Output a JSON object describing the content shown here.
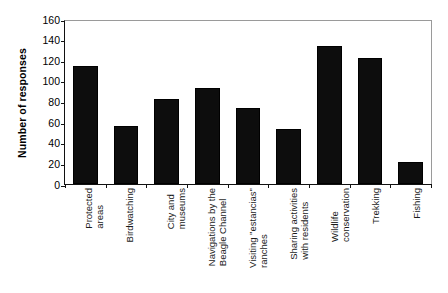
{
  "chart_data": {
    "type": "bar",
    "title": "",
    "xlabel": "",
    "ylabel": "Number of responses",
    "ylim": [
      0,
      160
    ],
    "ytick_step": 20,
    "yticks": [
      160,
      140,
      120,
      100,
      80,
      60,
      40,
      20,
      0
    ],
    "grid": false,
    "legend": null,
    "bar_color": "#0d0d0d",
    "categories": [
      "Protected areas",
      "Birdwatching",
      "City and museums",
      "Navigations by the Beagle Channel",
      "Visiting \"estancias\" ranches",
      "Sharing activities with residents",
      "Wildlife conservation",
      "Trekking",
      "Fishing"
    ],
    "category_lines": [
      [
        "Protected",
        "areas"
      ],
      [
        "Birdwatching",
        ""
      ],
      [
        "City and",
        "museums"
      ],
      [
        "Navigations by the",
        "Beagle Channel"
      ],
      [
        "Visiting \"estancias\"",
        "ranches"
      ],
      [
        "Sharing activities",
        "with residents"
      ],
      [
        "Wildlife",
        "conservation"
      ],
      [
        "Trekking",
        ""
      ],
      [
        "Fishing",
        ""
      ]
    ],
    "values": [
      114,
      56,
      82,
      93,
      73,
      53,
      133,
      122,
      21
    ]
  }
}
